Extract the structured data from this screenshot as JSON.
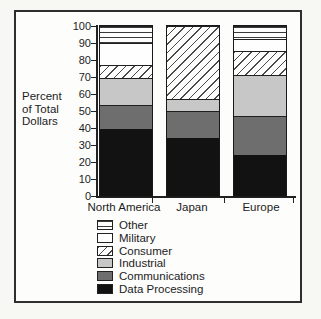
{
  "window": {
    "background": "#f7f7f4",
    "frame_border_color": "#2e2e2e"
  },
  "chart_data": {
    "type": "bar",
    "subtype": "stacked-percent",
    "title": "",
    "ylabel": "Percent of Total Dollars",
    "ylabel_lines": [
      "Percent",
      "of Total",
      "Dollars"
    ],
    "xlabel": "",
    "categories": [
      "North America",
      "Japan",
      "Europe"
    ],
    "series": [
      {
        "name": "Data Processing",
        "pattern": "black",
        "values": [
          39,
          34,
          24
        ]
      },
      {
        "name": "Communications",
        "pattern": "darkgray",
        "values": [
          14,
          16,
          23
        ]
      },
      {
        "name": "Industrial",
        "pattern": "lightgray",
        "values": [
          16,
          7,
          24
        ]
      },
      {
        "name": "Consumer",
        "pattern": "diagonal-hatch",
        "values": [
          8,
          43,
          14
        ]
      },
      {
        "name": "Military",
        "pattern": "white",
        "values": [
          13,
          0,
          7
        ]
      },
      {
        "name": "Other",
        "pattern": "horizontal-lines",
        "values": [
          10,
          0,
          8
        ]
      }
    ],
    "y_axis": {
      "min": 0,
      "max": 100,
      "ticks": [
        100,
        90,
        80,
        70,
        60,
        50,
        40,
        30,
        20,
        10,
        0
      ]
    },
    "legend": [
      {
        "label": "Other",
        "pattern": "horizontal-lines"
      },
      {
        "label": "Military",
        "pattern": "white"
      },
      {
        "label": "Consumer",
        "pattern": "diagonal-hatch"
      },
      {
        "label": "Industrial",
        "pattern": "lightgray"
      },
      {
        "label": "Communications",
        "pattern": "darkgray"
      },
      {
        "label": "Data Processing",
        "pattern": "black"
      }
    ],
    "legend_position": "bottom-left",
    "grid": false,
    "colors": {
      "black": "#121212",
      "darkgray": "#6e6e6e",
      "lightgray": "#c7c7c7",
      "white": "#fefefe",
      "axis_line": "#222222"
    }
  }
}
